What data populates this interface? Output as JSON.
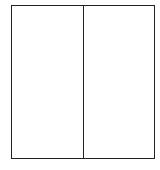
{
  "diagram": {
    "shape": "rectangle",
    "partitions": 2,
    "orientation": "vertical-split",
    "cells": [
      {
        "label": ""
      },
      {
        "label": ""
      }
    ],
    "stroke_color": "#222222",
    "fill_color": "#ffffff"
  }
}
